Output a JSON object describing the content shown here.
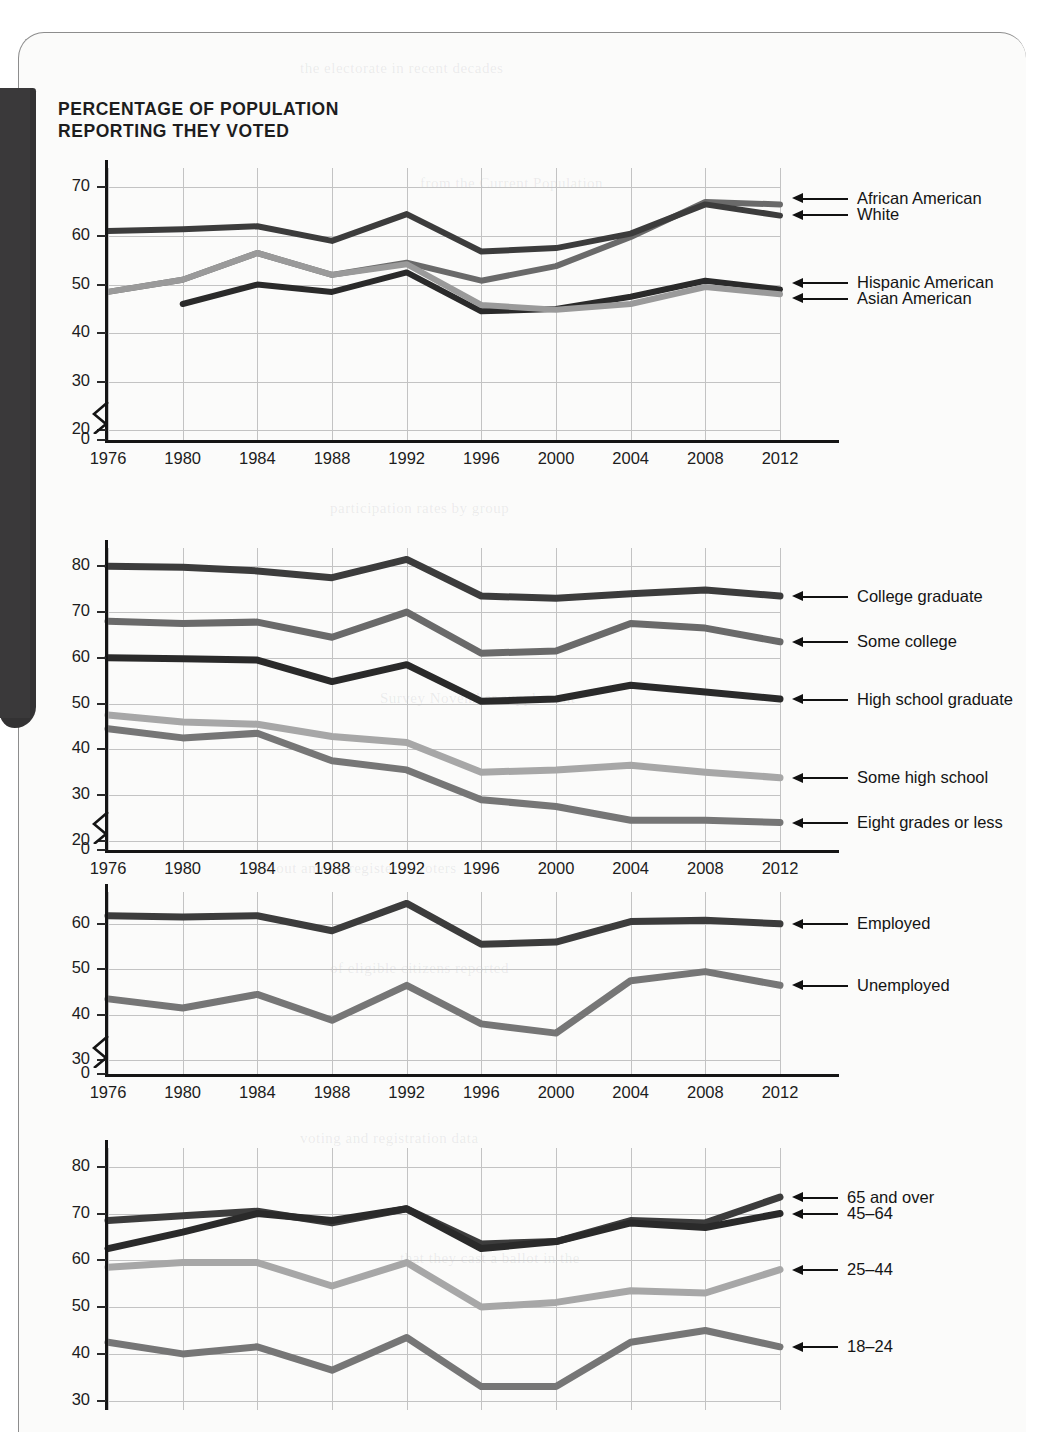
{
  "page": {
    "title": "PERCENTAGE OF POPULATION\nREPORTING THEY VOTED",
    "colors": {
      "ink": "#1b1b1b",
      "gridline": "#c3c3c3",
      "axis": "#151515",
      "tab": "#3a393a",
      "paper": "#fbfbfa"
    },
    "ghost_text": [
      "the electorate in recent decades",
      "participation rates by group",
      "turnout among registered voters",
      "voting and registration data",
      "from the Current Population",
      "Survey November supplement",
      "of eligible citizens reported",
      "that they cast a ballot in the"
    ]
  },
  "chart_data": [
    {
      "id": "race-ethnicity",
      "type": "line",
      "title": "",
      "xlabel": "",
      "ylabel": "",
      "x": [
        1976,
        1980,
        1984,
        1988,
        1992,
        1996,
        2000,
        2004,
        2008,
        2012
      ],
      "xticklabels": [
        "1976",
        "1980",
        "1984",
        "1988",
        "1992",
        "1996",
        "2000",
        "2004",
        "2008",
        "2012"
      ],
      "yticks": [
        0,
        20,
        30,
        40,
        50,
        60,
        70
      ],
      "yticklabels": [
        "0",
        "20",
        "30",
        "40",
        "50",
        "60",
        "70"
      ],
      "ylim": [
        18,
        74
      ],
      "axis_break": true,
      "grid": true,
      "legend_position": "right-callout",
      "series": [
        {
          "name": "African American",
          "color": "#6a6a6a",
          "width": 6,
          "values": [
            48.5,
            51.0,
            56.5,
            52.0,
            54.5,
            50.8,
            53.8,
            59.8,
            67.0,
            66.5
          ],
          "label_y": 67.8
        },
        {
          "name": "White",
          "color": "#3c3c3c",
          "width": 6,
          "values": [
            61.0,
            61.4,
            62.0,
            59.0,
            64.5,
            56.8,
            57.5,
            60.5,
            66.5,
            64.2
          ],
          "label_y": 64.4
        },
        {
          "name": "Hispanic American",
          "color": "#2a2a2a",
          "width": 6,
          "values": [
            null,
            46.0,
            50.0,
            48.5,
            52.5,
            44.5,
            45.0,
            47.5,
            50.8,
            49.0
          ],
          "label_y": 50.4
        },
        {
          "name": "Asian American",
          "color": "#9a9a9a",
          "width": 6,
          "values": [
            48.5,
            51.0,
            56.5,
            52.0,
            54.2,
            45.8,
            44.8,
            46.0,
            49.5,
            48.0
          ],
          "label_y": 47.2
        }
      ]
    },
    {
      "id": "education",
      "type": "line",
      "title": "",
      "xlabel": "",
      "ylabel": "",
      "x": [
        1976,
        1980,
        1984,
        1988,
        1992,
        1996,
        2000,
        2004,
        2008,
        2012
      ],
      "xticklabels": [
        "1976",
        "1980",
        "1984",
        "1988",
        "1992",
        "1996",
        "2000",
        "2004",
        "2008",
        "2012"
      ],
      "yticks": [
        0,
        20,
        30,
        40,
        50,
        60,
        70,
        80
      ],
      "yticklabels": [
        "0",
        "20",
        "30",
        "40",
        "50",
        "60",
        "70",
        "80"
      ],
      "ylim": [
        18,
        84
      ],
      "axis_break": true,
      "grid": true,
      "legend_position": "right-callout",
      "series": [
        {
          "name": "College graduate",
          "color": "#3c3c3c",
          "width": 7,
          "values": [
            80.0,
            79.8,
            79.0,
            77.5,
            81.5,
            73.5,
            73.0,
            74.0,
            74.8,
            73.5
          ],
          "label_y": 73.5
        },
        {
          "name": "Some college",
          "color": "#6a6a6a",
          "width": 7,
          "values": [
            68.0,
            67.5,
            67.8,
            64.5,
            70.0,
            61.0,
            61.5,
            67.5,
            66.5,
            63.5
          ],
          "label_y": 63.5
        },
        {
          "name": "High school graduate",
          "color": "#2a2a2a",
          "width": 7,
          "values": [
            60.0,
            59.8,
            59.5,
            54.8,
            58.5,
            50.5,
            51.0,
            54.0,
            52.5,
            51.0
          ],
          "label_y": 51.0
        },
        {
          "name": "Some high school",
          "color": "#a7a7a7",
          "width": 7,
          "values": [
            47.5,
            46.0,
            45.5,
            42.8,
            41.5,
            35.0,
            35.5,
            36.5,
            35.0,
            33.8
          ],
          "label_y": 33.8
        },
        {
          "name": "Eight grades or less",
          "color": "#767676",
          "width": 7,
          "values": [
            44.5,
            42.5,
            43.5,
            37.5,
            35.5,
            29.0,
            27.5,
            24.5,
            24.5,
            24.0
          ],
          "label_y": 24.0
        }
      ]
    },
    {
      "id": "employment",
      "type": "line",
      "title": "",
      "xlabel": "",
      "ylabel": "",
      "x": [
        1976,
        1980,
        1984,
        1988,
        1992,
        1996,
        2000,
        2004,
        2008,
        2012
      ],
      "xticklabels": [
        "1976",
        "1980",
        "1984",
        "1988",
        "1992",
        "1996",
        "2000",
        "2004",
        "2008",
        "2012"
      ],
      "yticks": [
        0,
        30,
        40,
        50,
        60
      ],
      "yticklabels": [
        "0",
        "30",
        "40",
        "50",
        "60"
      ],
      "ylim": [
        27,
        67
      ],
      "axis_break": true,
      "grid": true,
      "legend_position": "right-callout",
      "series": [
        {
          "name": "Employed",
          "color": "#3c3c3c",
          "width": 7,
          "values": [
            61.8,
            61.5,
            61.8,
            58.5,
            64.5,
            55.5,
            56.0,
            60.5,
            60.8,
            60.0
          ],
          "label_y": 60.0
        },
        {
          "name": "Unemployed",
          "color": "#767676",
          "width": 7,
          "values": [
            43.5,
            41.5,
            44.5,
            38.8,
            46.5,
            38.0,
            36.0,
            47.5,
            49.5,
            46.5
          ],
          "label_y": 46.5
        }
      ]
    },
    {
      "id": "age",
      "type": "line",
      "title": "",
      "xlabel": "",
      "ylabel": "",
      "x": [
        1976,
        1980,
        1984,
        1988,
        1992,
        1996,
        2000,
        2004,
        2008,
        2012
      ],
      "xticklabels": [
        "1976",
        "1980",
        "1984",
        "1988",
        "1992",
        "1996",
        "2000",
        "2004",
        "2008",
        "2012"
      ],
      "yticks": [
        30,
        40,
        50,
        60,
        70,
        80
      ],
      "yticklabels": [
        "30",
        "40",
        "50",
        "60",
        "70",
        "80"
      ],
      "ylim": [
        28,
        84
      ],
      "axis_break": false,
      "grid": true,
      "legend_position": "right-callout",
      "series": [
        {
          "name": "65 and over",
          "color": "#3c3c3c",
          "width": 7,
          "values": [
            68.5,
            69.5,
            70.5,
            68.0,
            71.0,
            63.5,
            64.0,
            68.5,
            68.0,
            73.5
          ],
          "label_y": 73.5
        },
        {
          "name": "45–64",
          "color": "#2a2a2a",
          "width": 7,
          "values": [
            62.5,
            66.0,
            70.0,
            68.5,
            71.0,
            62.5,
            64.0,
            68.0,
            67.0,
            70.0
          ],
          "label_y": 70.0
        },
        {
          "name": "25–44",
          "color": "#a7a7a7",
          "width": 7,
          "values": [
            58.5,
            59.5,
            59.5,
            54.5,
            59.5,
            50.0,
            51.0,
            53.5,
            53.0,
            58.0
          ],
          "label_y": 58.0
        },
        {
          "name": "18–24",
          "color": "#767676",
          "width": 7,
          "values": [
            42.5,
            40.0,
            41.5,
            36.5,
            43.5,
            33.0,
            33.0,
            42.5,
            45.0,
            41.5
          ],
          "label_y": 41.5
        }
      ]
    }
  ]
}
